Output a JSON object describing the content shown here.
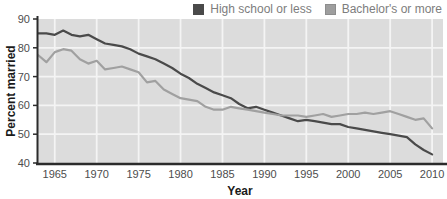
{
  "chart_data": {
    "type": "line",
    "title": "",
    "xlabel": "Year",
    "ylabel": "Percent married",
    "xlim": [
      1963,
      2011.3
    ],
    "ylim": [
      40,
      90
    ],
    "x_ticks": [
      1965,
      1970,
      1975,
      1980,
      1985,
      1990,
      1995,
      2000,
      2005,
      2010
    ],
    "y_ticks": [
      40,
      50,
      60,
      70,
      80,
      90
    ],
    "gridline_values_y": [
      50,
      60,
      70,
      80
    ],
    "grid": true,
    "legend_position": "top-right",
    "x": [
      1963,
      1964,
      1965,
      1966,
      1967,
      1968,
      1969,
      1970,
      1971,
      1972,
      1973,
      1974,
      1975,
      1976,
      1977,
      1978,
      1979,
      1980,
      1981,
      1982,
      1983,
      1984,
      1985,
      1986,
      1987,
      1988,
      1989,
      1990,
      1991,
      1992,
      1993,
      1994,
      1995,
      1996,
      1997,
      1998,
      1999,
      2000,
      2001,
      2002,
      2003,
      2004,
      2005,
      2006,
      2007,
      2008,
      2009,
      2010
    ],
    "series": [
      {
        "name": "High school or less",
        "color": "#4a4a4a",
        "values": [
          85,
          85,
          84.5,
          86,
          84.5,
          84,
          84.5,
          83,
          81.5,
          81,
          80.5,
          79.5,
          78,
          77,
          76,
          74.5,
          73,
          71,
          69.5,
          67.5,
          66,
          64.5,
          63.5,
          62.5,
          60.5,
          59,
          59.5,
          58.5,
          57.5,
          56.5,
          55.5,
          54.5,
          55,
          54.5,
          54,
          53.5,
          53.5,
          52.5,
          52,
          51.5,
          51,
          50.5,
          50,
          49.5,
          49,
          46.5,
          44.5,
          43
        ]
      },
      {
        "name": "Bachelor's or more",
        "color": "#a0a0a0",
        "values": [
          77.5,
          75,
          78.5,
          79.5,
          79,
          76,
          74.5,
          75.5,
          72.5,
          73,
          73.5,
          72.5,
          71.5,
          68,
          68.5,
          65.5,
          64,
          62.5,
          62,
          61.5,
          59.5,
          58.5,
          58.5,
          59.5,
          59,
          58.5,
          58,
          57.5,
          57,
          56.5,
          56.5,
          56.5,
          56,
          56.5,
          57,
          56,
          56.5,
          57,
          57,
          57.5,
          57,
          57.5,
          58,
          57,
          56,
          55,
          55.5,
          52
        ]
      }
    ],
    "colors": {
      "plot_background": "#dcdcdc",
      "gridline": "#f4f4f4",
      "axis": "#2b2b2b",
      "tick_label": "#4d4d4d",
      "axis_title": "#1a1a1a",
      "legend_text": "#7d7d7d"
    }
  }
}
